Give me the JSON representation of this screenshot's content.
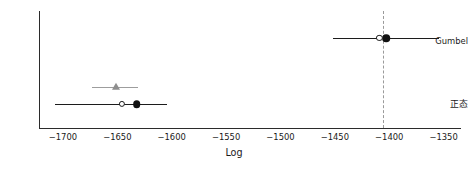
{
  "chart_data": {
    "type": "scatter",
    "title": "",
    "subtitle": "",
    "xlabel": "Log",
    "ylabel": "",
    "grid": false,
    "legend": "none",
    "xlim": [
      -1722,
      -1334
    ],
    "xticks": [
      -1700,
      -1650,
      -1600,
      -1550,
      -1500,
      -1450,
      -1400,
      -1350
    ],
    "xticklabels": [
      "−1700",
      "−1650",
      "−1600",
      "−1550",
      "−1500",
      "−1450",
      "−1400",
      "−1350"
    ],
    "categories": [
      "Gumbel",
      "正态"
    ],
    "yticklabels": [
      "Gumbel",
      "正态"
    ],
    "annotations": [
      {
        "name": "reference-line",
        "kind": "vertical-dashed-line",
        "x": -1406,
        "color": "#9a9a9a"
      }
    ],
    "series": [
      {
        "name": "primary",
        "marker": "circle-filled",
        "color": "#111111",
        "points": [
          {
            "category": "Gumbel",
            "value": -1403,
            "ci_low": -1452,
            "ci_high": -1354,
            "error_bar_color": "#1c1c1c"
          },
          {
            "category": "正态",
            "value": -1632,
            "ci_low": -1707,
            "ci_high": -1604,
            "error_bar_color": "#1c1c1c"
          }
        ]
      },
      {
        "name": "secondary",
        "marker": "circle-open",
        "color": "#1c1c1c",
        "points": [
          {
            "category": "Gumbel",
            "value": -1409,
            "ci_low": null,
            "ci_high": null
          },
          {
            "category": "正态",
            "value": -1646,
            "ci_low": null,
            "ci_high": null
          }
        ]
      },
      {
        "name": "tertiary",
        "marker": "triangle-up",
        "color": "#8e8e8e",
        "points": [
          {
            "category": "正态",
            "value": -1651,
            "ci_low": -1673,
            "ci_high": -1631,
            "error_bar_color": "#9d9d9d"
          }
        ]
      }
    ]
  }
}
